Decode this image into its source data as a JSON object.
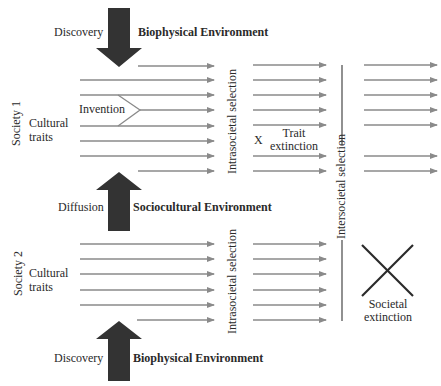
{
  "diagram": {
    "top_force": {
      "left_label": "Discovery",
      "right_label": "Biophysical Environment",
      "direction": "down"
    },
    "middle_force": {
      "left_label": "Diffusion",
      "right_label": "Sociocultural Environment",
      "direction": "up"
    },
    "bottom_force": {
      "left_label": "Discovery",
      "right_label": "Biophysical Environment",
      "direction": "up"
    },
    "society1": {
      "label": "Society 1",
      "traits_label_line1": "Cultural",
      "traits_label_line2": "traits",
      "invention_label": "Invention"
    },
    "society2": {
      "label": "Society 2",
      "traits_label_line1": "Cultural",
      "traits_label_line2": "traits"
    },
    "intrasocietal_label": "Intrasocietal selection",
    "intersocietal_label": "Intersocietal selection",
    "trait_extinction": {
      "marker": "X",
      "line1": "Trait",
      "line2": "extinction"
    },
    "societal_extinction": {
      "line1": "Societal",
      "line2": "extinction"
    },
    "colors": {
      "arrow": "#8a8a8a",
      "big_arrow": "#333333",
      "text": "#2a2a2a",
      "line": "#555555"
    }
  }
}
